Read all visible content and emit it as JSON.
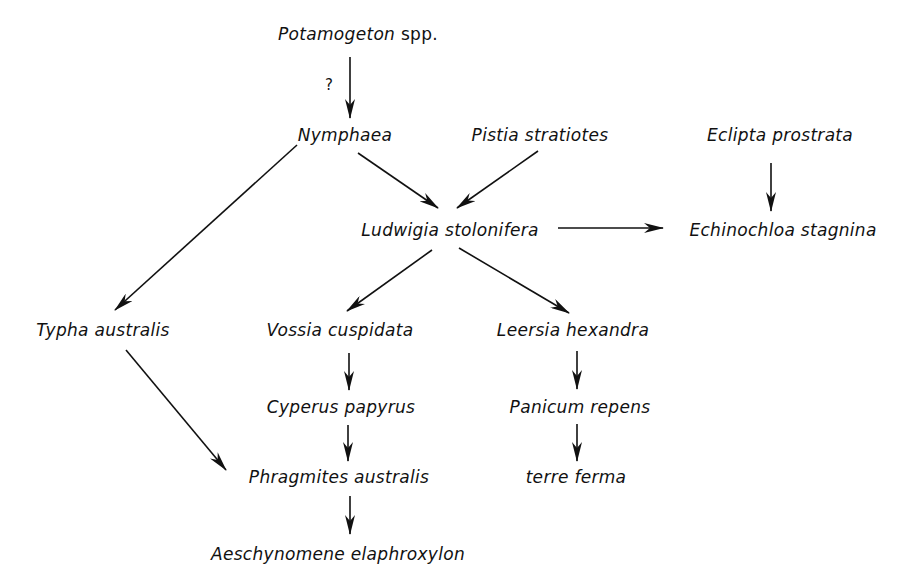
{
  "diagram": {
    "type": "succession-flow",
    "nodes": [
      {
        "id": "potamogeton",
        "label": "Potamogeton",
        "suffix": "spp.",
        "x": 358,
        "y": 24
      },
      {
        "id": "nymphaea",
        "label": "Nymphaea",
        "x": 345,
        "y": 125
      },
      {
        "id": "pistia",
        "label": "Pistia stratiotes",
        "x": 540,
        "y": 125
      },
      {
        "id": "eclipta",
        "label": "Eclipta prostrata",
        "x": 780,
        "y": 125
      },
      {
        "id": "ludwigia",
        "label": "Ludwigia stolonifera",
        "x": 450,
        "y": 220
      },
      {
        "id": "echinochloa",
        "label": "Echinochloa stagnina",
        "x": 783,
        "y": 220
      },
      {
        "id": "typha",
        "label": "Typha australis",
        "x": 103,
        "y": 320
      },
      {
        "id": "vossia",
        "label": "Vossia cuspidata",
        "x": 340,
        "y": 320
      },
      {
        "id": "leersia",
        "label": "Leersia hexandra",
        "x": 573,
        "y": 320
      },
      {
        "id": "cyperus",
        "label": "Cyperus papyrus",
        "x": 341,
        "y": 397
      },
      {
        "id": "panicum",
        "label": "Panicum repens",
        "x": 580,
        "y": 397
      },
      {
        "id": "phragmites",
        "label": "Phragmites australis",
        "x": 339,
        "y": 467
      },
      {
        "id": "terre",
        "label": "terre ferma",
        "x": 576,
        "y": 467
      },
      {
        "id": "aeschynomene",
        "label": "Aeschynomene elaphroxylon",
        "x": 338,
        "y": 544
      }
    ],
    "uncertain_mark": "?",
    "edges": [
      {
        "from": "potamogeton",
        "to": "nymphaea",
        "uncertain": true
      },
      {
        "from": "nymphaea",
        "to": "ludwigia"
      },
      {
        "from": "pistia",
        "to": "ludwigia"
      },
      {
        "from": "nymphaea",
        "to": "typha"
      },
      {
        "from": "eclipta",
        "to": "echinochloa"
      },
      {
        "from": "ludwigia",
        "to": "echinochloa"
      },
      {
        "from": "ludwigia",
        "to": "vossia"
      },
      {
        "from": "ludwigia",
        "to": "leersia"
      },
      {
        "from": "vossia",
        "to": "cyperus"
      },
      {
        "from": "cyperus",
        "to": "phragmites"
      },
      {
        "from": "typha",
        "to": "phragmites"
      },
      {
        "from": "phragmites",
        "to": "aeschynomene"
      },
      {
        "from": "leersia",
        "to": "panicum"
      },
      {
        "from": "panicum",
        "to": "terre"
      }
    ]
  }
}
